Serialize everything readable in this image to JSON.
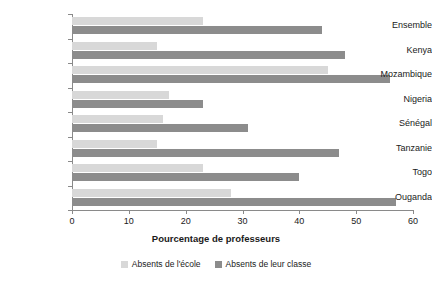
{
  "chart_data": {
    "type": "bar",
    "orientation": "horizontal",
    "title": "",
    "xlabel": "Pourcentage de professeurs",
    "ylabel": "",
    "xlim": [
      0,
      60
    ],
    "xticks": [
      0,
      10,
      20,
      30,
      40,
      50,
      60
    ],
    "grid": false,
    "legend_position": "bottom",
    "categories": [
      "Ensemble",
      "Kenya",
      "Mozambique",
      "Nigeria",
      "Sénégal",
      "Tanzanie",
      "Togo",
      "Ouganda"
    ],
    "series": [
      {
        "name": "Absents de l'école",
        "color": "#d8d8d8",
        "values": [
          23,
          15,
          45,
          17,
          16,
          15,
          23,
          28
        ]
      },
      {
        "name": "Absents de leur classe",
        "color": "#8c8c8c",
        "values": [
          44,
          48,
          56,
          23,
          31,
          47,
          40,
          57
        ]
      }
    ]
  },
  "axis": {
    "x_title": "Pourcentage de professeurs",
    "tick_labels": [
      "0",
      "10",
      "20",
      "30",
      "40",
      "50",
      "60"
    ]
  },
  "legend": {
    "items": [
      {
        "label": "Absents de l'école",
        "color": "#d8d8d8"
      },
      {
        "label": "Absents de leur classe",
        "color": "#8c8c8c"
      }
    ]
  }
}
